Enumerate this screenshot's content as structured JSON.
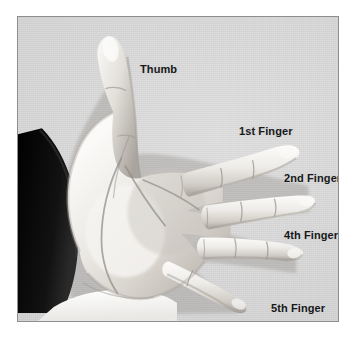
{
  "figure": {
    "name": "hand-anatomy-figure",
    "frame": {
      "border_color": "#8e8e8e",
      "page_background": "#ffffff",
      "plate_background": "#d4d4d4"
    }
  },
  "labels": [
    {
      "id": "thumb",
      "text": "Thumb"
    },
    {
      "id": "finger1",
      "text": "1st Finger"
    },
    {
      "id": "finger2",
      "text": "2nd Finger"
    },
    {
      "id": "finger4",
      "text": "4th Finger"
    },
    {
      "id": "finger5",
      "text": "5th Finger"
    }
  ],
  "colors": {
    "label_text": "#16181a",
    "skin_light": "#f2f1ee",
    "skin_mid": "#d0cdc7",
    "skin_shadow": "#9a968f",
    "crease": "#8d8a84",
    "sleeve_dark": "#141414",
    "cuff_light": "#f4f4f2"
  }
}
